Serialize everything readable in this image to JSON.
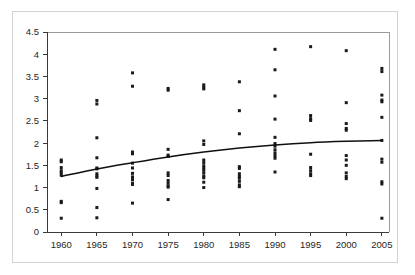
{
  "figure": {
    "background_color": "#ffffff",
    "frame_color": "#d2d2d2",
    "point_color": "#1a1a1a",
    "curve_color": "#101010",
    "axis_color": "#3a3a3a"
  },
  "chart_data": {
    "type": "scatter",
    "title": "",
    "subtitle": "",
    "xlabel": "",
    "ylabel": "",
    "xlim": [
      1958,
      2006
    ],
    "ylim": [
      0,
      4.5
    ],
    "grid": false,
    "legend": null,
    "legend_position": "none",
    "x_ticks": [
      1960,
      1965,
      1970,
      1975,
      1980,
      1985,
      1990,
      1995,
      2000,
      2005
    ],
    "x_tick_labels": [
      "1960",
      "1965",
      "1970",
      "1975",
      "1980",
      "1985",
      "1990",
      "1995",
      "2000",
      "2005"
    ],
    "y_ticks": [
      0,
      0.5,
      1,
      1.5,
      2,
      2.5,
      3,
      3.5,
      4,
      4.5
    ],
    "y_tick_labels": [
      "0",
      "0.5",
      "1",
      "1.5",
      "2",
      "2.5",
      "3",
      "3.5",
      "4",
      "4.5"
    ],
    "series": [
      {
        "name": "observations",
        "marker": "square",
        "marker_size": 3,
        "points": [
          [
            1960,
            1.62
          ],
          [
            1960,
            1.58
          ],
          [
            1960,
            1.45
          ],
          [
            1960,
            1.38
          ],
          [
            1960,
            1.33
          ],
          [
            1960,
            1.28
          ],
          [
            1960,
            0.69
          ],
          [
            1960,
            0.66
          ],
          [
            1960,
            0.31
          ],
          [
            1965,
            2.96
          ],
          [
            1965,
            2.88
          ],
          [
            1965,
            2.12
          ],
          [
            1965,
            1.67
          ],
          [
            1965,
            1.44
          ],
          [
            1965,
            1.42
          ],
          [
            1965,
            1.31
          ],
          [
            1965,
            1.26
          ],
          [
            1965,
            1.23
          ],
          [
            1965,
            0.98
          ],
          [
            1965,
            0.55
          ],
          [
            1965,
            0.32
          ],
          [
            1970,
            3.58
          ],
          [
            1970,
            3.28
          ],
          [
            1970,
            1.8
          ],
          [
            1970,
            1.76
          ],
          [
            1970,
            1.55
          ],
          [
            1970,
            1.44
          ],
          [
            1970,
            1.32
          ],
          [
            1970,
            1.24
          ],
          [
            1970,
            1.18
          ],
          [
            1970,
            1.1
          ],
          [
            1970,
            1.07
          ],
          [
            1970,
            0.65
          ],
          [
            1975,
            3.23
          ],
          [
            1975,
            3.19
          ],
          [
            1975,
            1.86
          ],
          [
            1975,
            1.73
          ],
          [
            1975,
            1.7
          ],
          [
            1975,
            1.33
          ],
          [
            1975,
            1.27
          ],
          [
            1975,
            1.16
          ],
          [
            1975,
            1.1
          ],
          [
            1975,
            1.04
          ],
          [
            1975,
            1.01
          ],
          [
            1975,
            0.73
          ],
          [
            1980,
            3.31
          ],
          [
            1980,
            3.26
          ],
          [
            1980,
            3.22
          ],
          [
            1980,
            2.05
          ],
          [
            1980,
            1.97
          ],
          [
            1980,
            1.62
          ],
          [
            1980,
            1.56
          ],
          [
            1980,
            1.49
          ],
          [
            1980,
            1.44
          ],
          [
            1980,
            1.39
          ],
          [
            1980,
            1.33
          ],
          [
            1980,
            1.26
          ],
          [
            1980,
            1.22
          ],
          [
            1980,
            1.12
          ],
          [
            1980,
            1.0
          ],
          [
            1985,
            3.38
          ],
          [
            1985,
            2.73
          ],
          [
            1985,
            2.21
          ],
          [
            1985,
            1.47
          ],
          [
            1985,
            1.43
          ],
          [
            1985,
            1.31
          ],
          [
            1985,
            1.25
          ],
          [
            1985,
            1.21
          ],
          [
            1985,
            1.14
          ],
          [
            1985,
            1.06
          ],
          [
            1985,
            1.02
          ],
          [
            1990,
            4.11
          ],
          [
            1990,
            3.65
          ],
          [
            1990,
            3.06
          ],
          [
            1990,
            2.54
          ],
          [
            1990,
            2.13
          ],
          [
            1990,
            1.99
          ],
          [
            1990,
            1.93
          ],
          [
            1990,
            1.85
          ],
          [
            1990,
            1.78
          ],
          [
            1990,
            1.72
          ],
          [
            1990,
            1.66
          ],
          [
            1990,
            1.35
          ],
          [
            1995,
            4.17
          ],
          [
            1995,
            2.62
          ],
          [
            1995,
            2.55
          ],
          [
            1995,
            2.51
          ],
          [
            1995,
            1.75
          ],
          [
            1995,
            1.45
          ],
          [
            1995,
            1.38
          ],
          [
            1995,
            1.31
          ],
          [
            1995,
            1.27
          ],
          [
            2000,
            4.08
          ],
          [
            2000,
            2.91
          ],
          [
            2000,
            2.44
          ],
          [
            2000,
            2.33
          ],
          [
            2000,
            2.29
          ],
          [
            2000,
            1.72
          ],
          [
            2000,
            1.62
          ],
          [
            2000,
            1.5
          ],
          [
            2000,
            1.33
          ],
          [
            2000,
            1.25
          ],
          [
            2000,
            1.2
          ],
          [
            2005,
            3.68
          ],
          [
            2005,
            3.61
          ],
          [
            2005,
            3.08
          ],
          [
            2005,
            2.97
          ],
          [
            2005,
            2.93
          ],
          [
            2005,
            2.58
          ],
          [
            2005,
            2.06
          ],
          [
            2005,
            1.64
          ],
          [
            2005,
            1.57
          ],
          [
            2005,
            1.13
          ],
          [
            2005,
            1.08
          ],
          [
            2005,
            0.31
          ]
        ]
      }
    ],
    "trend_line": {
      "name": "fitted trend",
      "shape": "concave-increasing",
      "x": [
        1960,
        1965,
        1970,
        1975,
        1980,
        1985,
        1990,
        1995,
        2000,
        2005
      ],
      "y": [
        1.25,
        1.42,
        1.56,
        1.69,
        1.8,
        1.89,
        1.96,
        2.01,
        2.04,
        2.06
      ]
    }
  }
}
